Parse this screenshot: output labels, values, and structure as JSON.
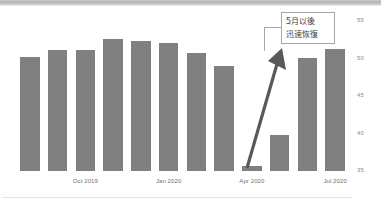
{
  "chart_data": {
    "type": "bar",
    "title": "",
    "subtitle": "",
    "xlabel": "",
    "ylabel": "",
    "ylim": [
      35,
      56
    ],
    "grid": false,
    "legend": null,
    "bar_color": "#808080",
    "categories": [
      "Aug 2019",
      "Sep 2019",
      "Oct 2019",
      "Nov 2019",
      "Dec 2019",
      "Jan 2020",
      "Feb 2020",
      "Mar 2020",
      "Apr 2020",
      "May 2020",
      "Jun 2020",
      "Jul 2020"
    ],
    "values": [
      50.2,
      51.2,
      51.2,
      52.6,
      52.4,
      52.1,
      50.8,
      49.1,
      35.7,
      39.8,
      50.1,
      51.3
    ],
    "y_ticks": [
      "55",
      "50",
      "45",
      "40",
      "35"
    ],
    "y_tick_values": [
      55,
      50,
      45,
      40,
      35
    ],
    "x_ticks": [
      "Oct 2019",
      "Jan 2020",
      "Apr 2020",
      "Jul 2020"
    ],
    "x_tick_indices": [
      2,
      5,
      8,
      11
    ],
    "annotations": [
      {
        "name": "recovery-callout",
        "lines": [
          "5月以後",
          "迅速恢復"
        ],
        "arrow": {
          "name": "recovery-arrow",
          "color": "#595959",
          "from_label": "Apr 2020",
          "to_label": "May 2020 recovery",
          "direction": "up-right"
        }
      }
    ]
  },
  "callout": {
    "line1": "5月以後",
    "line2": "迅速恢復"
  },
  "axis": {
    "y": {
      "t0": "55",
      "t1": "50",
      "t2": "45",
      "t3": "40",
      "t4": "35"
    },
    "x": {
      "t0": "Oct 2019",
      "t1": "Jan 2020",
      "t2": "Apr 2020",
      "t3": "Jul 2020"
    }
  }
}
